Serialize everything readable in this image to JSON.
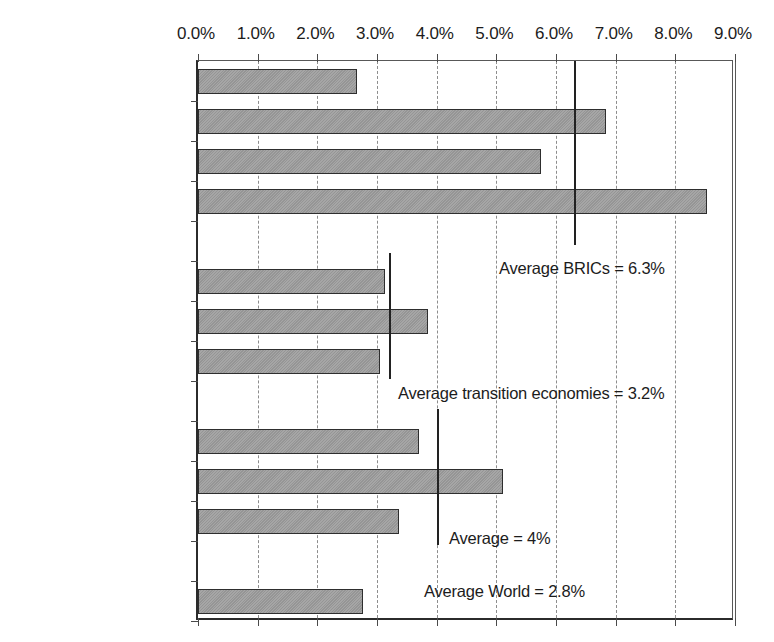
{
  "chart_data": {
    "type": "bar",
    "orientation": "horizontal",
    "title": "",
    "xlabel": "",
    "ylabel": "",
    "xlim": [
      0,
      9
    ],
    "xtick_labels": [
      "0.0%",
      "1.0%",
      "2.0%",
      "3.0%",
      "4.0%",
      "5.0%",
      "6.0%",
      "7.0%",
      "8.0%",
      "9.0%"
    ],
    "xticks": [
      0,
      1,
      2,
      3,
      4,
      5,
      6,
      7,
      8,
      9
    ],
    "grid": true,
    "grid_style": "dashed-vertical",
    "legend": "none",
    "categories": [
      "Brazil",
      "Russia",
      "India",
      "China",
      "Czech Republic",
      "Hungary",
      "Poland",
      "Chile",
      "Malaysia",
      "South Africa",
      "World"
    ],
    "values": [
      2.66,
      6.84,
      5.75,
      8.53,
      3.14,
      3.86,
      3.05,
      3.71,
      5.12,
      3.37,
      2.77
    ],
    "groups": [
      {
        "name": "BRICs",
        "categories": [
          "Brazil",
          "Russia",
          "India",
          "China"
        ]
      },
      {
        "name": "Transition economies",
        "categories": [
          "Czech Republic",
          "Hungary",
          "Poland"
        ]
      },
      {
        "name": "Other emerging",
        "categories": [
          "Chile",
          "Malaysia",
          "South Africa"
        ]
      },
      {
        "name": "World",
        "categories": [
          "World"
        ]
      }
    ],
    "annotations": [
      {
        "label": "Average BRICs = 6.3%",
        "value": 6.3
      },
      {
        "label": "Average transition economies = 3.2%",
        "value": 3.2
      },
      {
        "label": "Average = 4%",
        "value": 4.0
      },
      {
        "label": "Average World = 2.8%",
        "value": 2.8
      }
    ],
    "bar_color": "#9c9c9c",
    "bar_edge_color": "#2e2e2e"
  },
  "axis": {
    "ticks": [
      {
        "label": "0.0%",
        "value": 0
      },
      {
        "label": "1.0%",
        "value": 1
      },
      {
        "label": "2.0%",
        "value": 2
      },
      {
        "label": "3.0%",
        "value": 3
      },
      {
        "label": "4.0%",
        "value": 4
      },
      {
        "label": "5.0%",
        "value": 5
      },
      {
        "label": "6.0%",
        "value": 6
      },
      {
        "label": "7.0%",
        "value": 7
      },
      {
        "label": "8.0%",
        "value": 8
      },
      {
        "label": "9.0%",
        "value": 9
      }
    ]
  },
  "rows": [
    {
      "label": "Brazil",
      "value": 2.66,
      "bar": true
    },
    {
      "label": "Russia",
      "value": 6.84,
      "bar": true
    },
    {
      "label": "India",
      "value": 5.75,
      "bar": true
    },
    {
      "label": "China",
      "value": 8.53,
      "bar": true
    },
    {
      "label": "",
      "value": 0,
      "bar": false
    },
    {
      "label": "Czech Republic",
      "value": 3.14,
      "bar": true
    },
    {
      "label": "Hungary",
      "value": 3.86,
      "bar": true
    },
    {
      "label": "Poland",
      "value": 3.05,
      "bar": true
    },
    {
      "label": "",
      "value": 0,
      "bar": false
    },
    {
      "label": "Chile",
      "value": 3.71,
      "bar": true
    },
    {
      "label": "Malaysia",
      "value": 5.12,
      "bar": true
    },
    {
      "label": "South Africa",
      "value": 3.37,
      "bar": true
    },
    {
      "label": "",
      "value": 0,
      "bar": false
    },
    {
      "label": "World",
      "value": 2.77,
      "bar": true
    }
  ],
  "averages": [
    {
      "key": "brics",
      "label": "Average BRICs = 6.3%",
      "value": 6.3
    },
    {
      "key": "transition",
      "label": "Average transition economies = 3.2%",
      "value": 3.2
    },
    {
      "key": "overall",
      "label": "Average = 4%",
      "value": 4.0
    },
    {
      "key": "world",
      "label": "Average World = 2.8%",
      "value": 2.8
    }
  ],
  "colors": {
    "bar_fill": "#9c9c9c",
    "bar_edge": "#2e2e2e",
    "grid": "#8d8d8d",
    "axis": "#2b2b2b",
    "text": "#1c1c1c"
  }
}
